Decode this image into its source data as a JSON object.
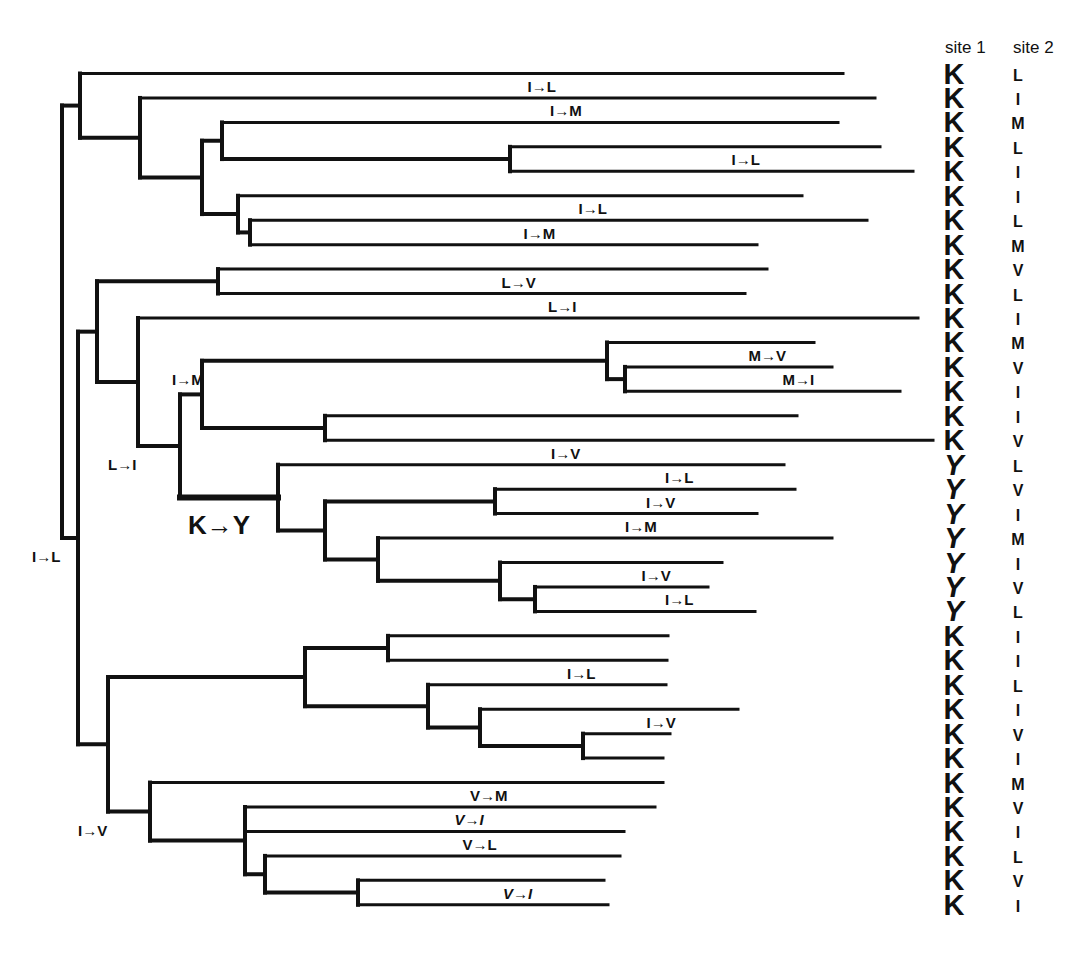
{
  "columns": {
    "site1_label": "site 1",
    "site2_label": "site 2"
  },
  "tips": [
    {
      "site1": "K",
      "site2": "L"
    },
    {
      "site1": "K",
      "site2": "I"
    },
    {
      "site1": "K",
      "site2": "M"
    },
    {
      "site1": "K",
      "site2": "L"
    },
    {
      "site1": "K",
      "site2": "I"
    },
    {
      "site1": "K",
      "site2": "I"
    },
    {
      "site1": "K",
      "site2": "L"
    },
    {
      "site1": "K",
      "site2": "M"
    },
    {
      "site1": "K",
      "site2": "V"
    },
    {
      "site1": "K",
      "site2": "L"
    },
    {
      "site1": "K",
      "site2": "I"
    },
    {
      "site1": "K",
      "site2": "M"
    },
    {
      "site1": "K",
      "site2": "V"
    },
    {
      "site1": "K",
      "site2": "I"
    },
    {
      "site1": "K",
      "site2": "I"
    },
    {
      "site1": "K",
      "site2": "V"
    },
    {
      "site1": "Y",
      "site2": "L"
    },
    {
      "site1": "Y",
      "site2": "V"
    },
    {
      "site1": "Y",
      "site2": "I"
    },
    {
      "site1": "Y",
      "site2": "M"
    },
    {
      "site1": "Y",
      "site2": "I"
    },
    {
      "site1": "Y",
      "site2": "V"
    },
    {
      "site1": "Y",
      "site2": "L"
    },
    {
      "site1": "K",
      "site2": "I"
    },
    {
      "site1": "K",
      "site2": "I"
    },
    {
      "site1": "K",
      "site2": "L"
    },
    {
      "site1": "K",
      "site2": "I"
    },
    {
      "site1": "K",
      "site2": "V"
    },
    {
      "site1": "K",
      "site2": "I"
    },
    {
      "site1": "K",
      "site2": "M"
    },
    {
      "site1": "K",
      "site2": "V"
    },
    {
      "site1": "K",
      "site2": "I"
    },
    {
      "site1": "K",
      "site2": "L"
    },
    {
      "site1": "K",
      "site2": "V"
    },
    {
      "site1": "K",
      "site2": "I"
    }
  ],
  "tree": {
    "depth_units": "relative branch length",
    "root": {
      "d": 0,
      "children": [
        {
          "d": 0.18,
          "children": [
            {
              "tip": 0,
              "d": 7.81
            },
            {
              "d": 0.78,
              "children": [
                {
                  "tip": 1,
                  "d": 8.13,
                  "mutation": "I→L"
                },
                {
                  "d": 1.4,
                  "children": [
                    {
                      "d": 1.6,
                      "children": [
                        {
                          "tip": 2,
                          "d": 7.76,
                          "mutation": "I→M"
                        },
                        {
                          "d": 4.48,
                          "children": [
                            {
                              "tip": 3,
                              "d": 8.18
                            },
                            {
                              "tip": 4,
                              "d": 8.51,
                              "mutation": "I→L"
                            }
                          ]
                        }
                      ]
                    },
                    {
                      "d": 1.76,
                      "children": [
                        {
                          "tip": 5,
                          "d": 7.4
                        },
                        {
                          "d": 1.88,
                          "children": [
                            {
                              "tip": 6,
                              "d": 8.05,
                              "mutation": "I→L"
                            },
                            {
                              "tip": 7,
                              "d": 6.95,
                              "mutation": "I→M"
                            }
                          ]
                        }
                      ]
                    }
                  ]
                }
              ]
            }
          ]
        },
        {
          "d": 0.16,
          "mutation": "I→L",
          "children": [
            {
              "d": 0.35,
              "children": [
                {
                  "d": 1.56,
                  "children": [
                    {
                      "tip": 8,
                      "d": 7.05
                    },
                    {
                      "tip": 9,
                      "d": 6.83,
                      "mutation": "L→V"
                    }
                  ]
                },
                {
                  "d": 0.76,
                  "children": [
                    {
                      "tip": 10,
                      "d": 8.56,
                      "mutation": "L→I"
                    },
                    {
                      "d": 1.18,
                      "mutation": "L→I",
                      "children": [
                        {
                          "d": 1.4,
                          "children": [
                            {
                              "d": 5.45,
                              "mutation": "I→M",
                              "children": [
                                {
                                  "tip": 11,
                                  "d": 7.52
                                },
                                {
                                  "d": 5.63,
                                  "children": [
                                    {
                                      "tip": 12,
                                      "d": 7.7,
                                      "mutation": "M→V"
                                    },
                                    {
                                      "tip": 13,
                                      "d": 8.38,
                                      "mutation": "M→I"
                                    }
                                  ]
                                }
                              ]
                            },
                            {
                              "d": 2.63,
                              "children": [
                                {
                                  "tip": 14,
                                  "d": 7.35
                                },
                                {
                                  "tip": 15,
                                  "d": 8.71
                                }
                              ]
                            }
                          ]
                        },
                        {
                          "d": 2.16,
                          "mutation": "K→Y",
                          "mutation_style": "major",
                          "children": [
                            {
                              "tip": 16,
                              "d": 7.22,
                              "mutation": "I→V"
                            },
                            {
                              "d": 2.63,
                              "children": [
                                {
                                  "d": 4.33,
                                  "children": [
                                    {
                                      "tip": 17,
                                      "d": 7.33,
                                      "mutation": "I→L"
                                    },
                                    {
                                      "tip": 18,
                                      "d": 6.95,
                                      "mutation": "I→V"
                                    }
                                  ]
                                },
                                {
                                  "d": 3.16,
                                  "children": [
                                    {
                                      "tip": 19,
                                      "d": 7.7,
                                      "mutation": "I→M"
                                    },
                                    {
                                      "d": 4.38,
                                      "children": [
                                        {
                                          "tip": 20,
                                          "d": 6.6
                                        },
                                        {
                                          "d": 4.73,
                                          "children": [
                                            {
                                              "tip": 21,
                                              "d": 6.46,
                                              "mutation": "I→V"
                                            },
                                            {
                                              "tip": 22,
                                              "d": 6.93,
                                              "mutation": "I→L"
                                            }
                                          ]
                                        }
                                      ]
                                    }
                                  ]
                                }
                              ]
                            }
                          ]
                        }
                      ]
                    }
                  ]
                }
              ]
            },
            {
              "d": 0.46,
              "children": [
                {
                  "d": 2.43,
                  "children": [
                    {
                      "d": 3.26,
                      "children": [
                        {
                          "tip": 23,
                          "d": 6.06
                        },
                        {
                          "tip": 24,
                          "d": 6.05
                        }
                      ]
                    },
                    {
                      "d": 3.66,
                      "children": [
                        {
                          "tip": 25,
                          "d": 6.04,
                          "mutation": "I→L"
                        },
                        {
                          "d": 4.18,
                          "children": [
                            {
                              "tip": 26,
                              "d": 6.76
                            },
                            {
                              "d": 5.21,
                              "children": [
                                {
                                  "tip": 27,
                                  "d": 6.08,
                                  "mutation": "I→V"
                                },
                                {
                                  "tip": 28,
                                  "d": 6.01
                                }
                              ]
                            }
                          ]
                        }
                      ]
                    }
                  ]
                },
                {
                  "d": 0.88,
                  "mutation": "I→V",
                  "children": [
                    {
                      "tip": 29,
                      "d": 6.01
                    },
                    {
                      "d": 1.83,
                      "children": [
                        {
                          "tip": 30,
                          "d": 5.93,
                          "mutation": "V→M"
                        },
                        {
                          "tip": 31,
                          "d": 5.62,
                          "mutation": "V→I"
                        },
                        {
                          "d": 2.03,
                          "children": [
                            {
                              "tip": 32,
                              "d": 5.58,
                              "mutation": "V→L"
                            },
                            {
                              "d": 2.96,
                              "children": [
                                {
                                  "tip": 33,
                                  "d": 5.42
                                },
                                {
                                  "tip": 34,
                                  "d": 5.46,
                                  "mutation": "V→I"
                                }
                              ]
                            }
                          ]
                        }
                      ]
                    }
                  ]
                }
              ]
            }
          ]
        }
      ]
    }
  }
}
